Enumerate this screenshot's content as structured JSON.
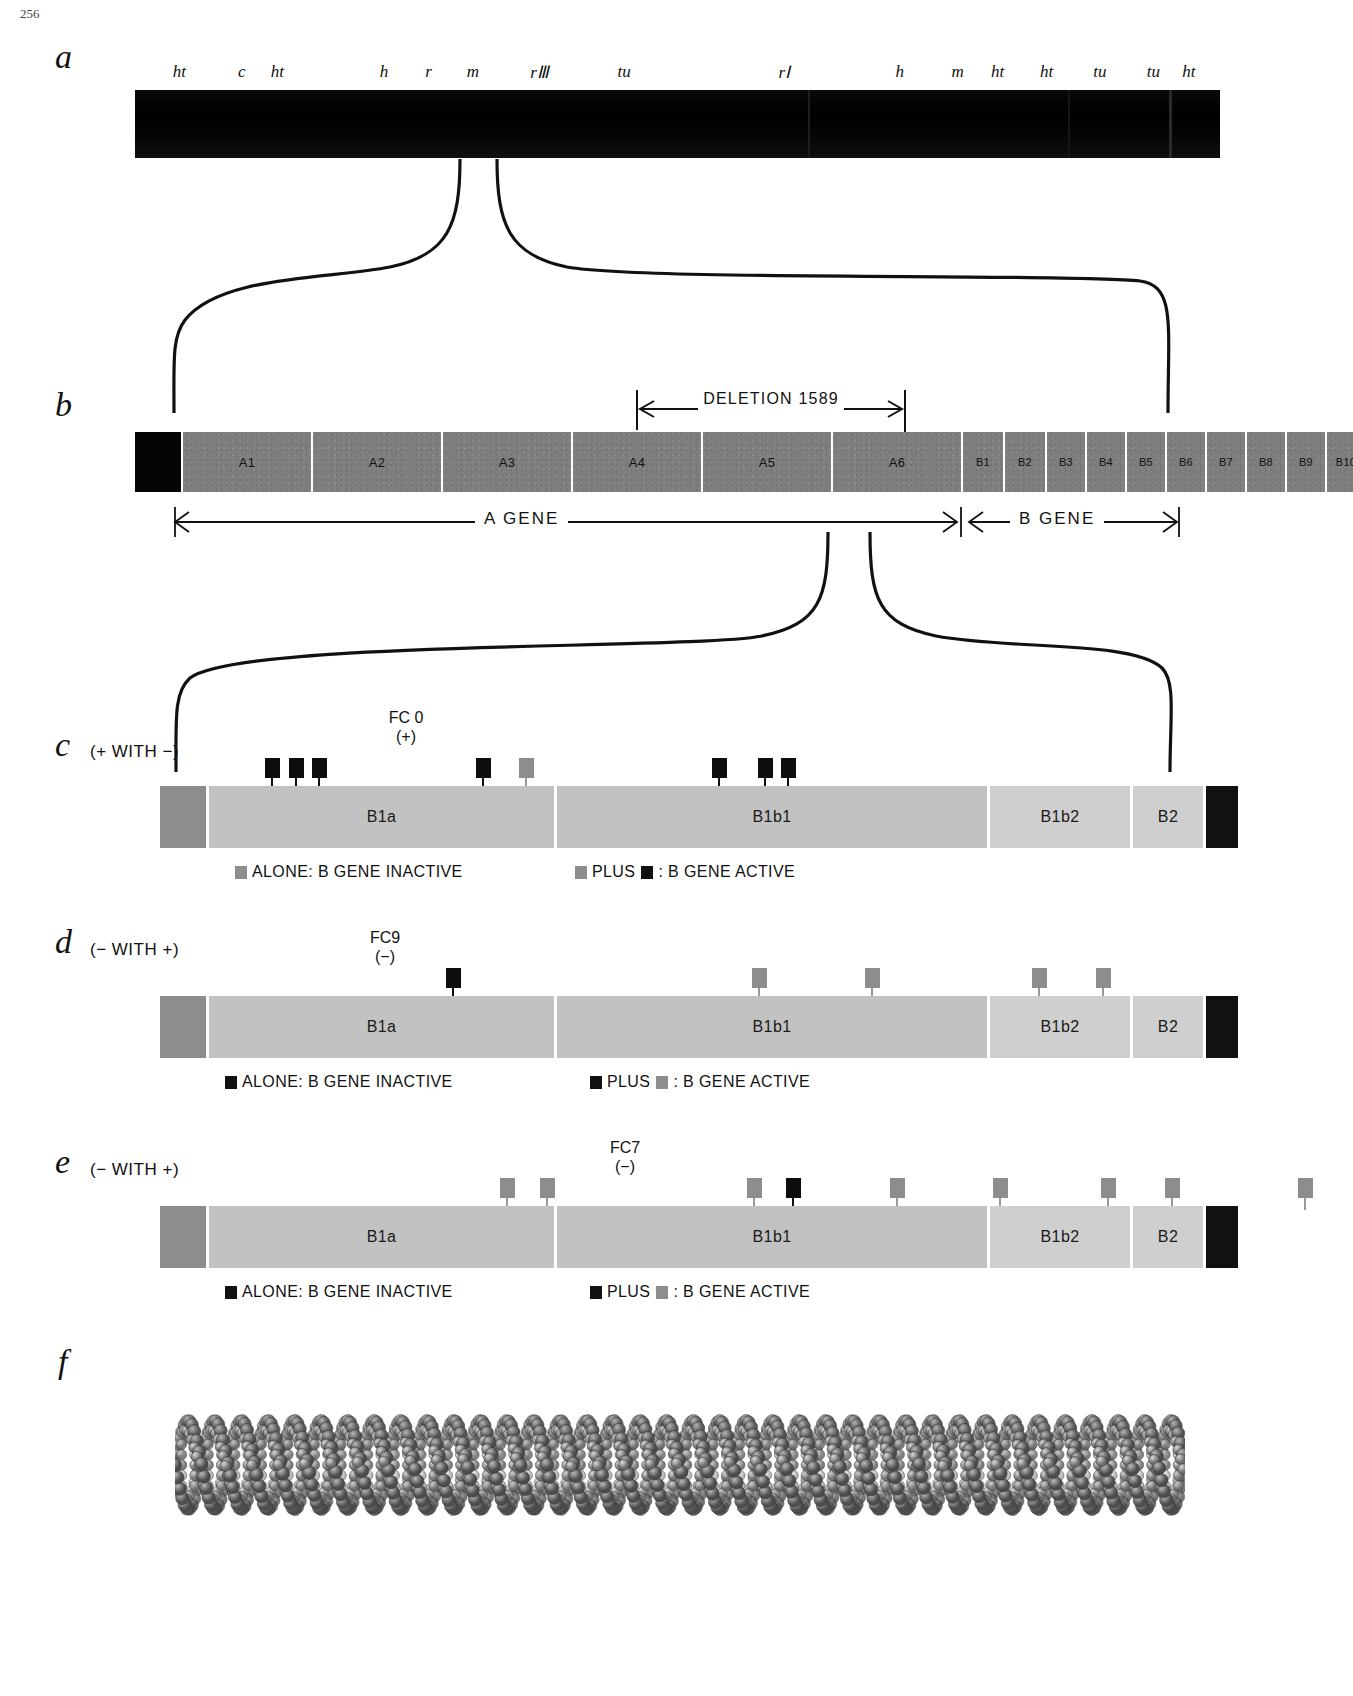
{
  "page": {
    "number": "256"
  },
  "panels": {
    "a": {
      "letter": "a",
      "caption": "",
      "genetic_markers": [
        "ht",
        "c",
        "ht",
        "h",
        "r",
        "m",
        "rII",
        "tu",
        "rI",
        "h",
        "m",
        "ht",
        "ht",
        "tu",
        "tu",
        "ht"
      ],
      "marker_positions_pct": [
        5.0,
        12.0,
        16.0,
        28.0,
        33.0,
        38.0,
        45.5,
        55.0,
        73.0,
        86.0,
        92.5,
        97.0,
        102.5,
        108.5,
        114.5,
        118.5
      ],
      "bar_color": "#050505"
    },
    "b": {
      "letter": "b",
      "deletion_label": "DELETION 1589",
      "a_gene_label": "A GENE",
      "b_gene_label": "B GENE",
      "a_segments": [
        "A1",
        "A2",
        "A3",
        "A4",
        "A5",
        "A6"
      ],
      "b_segments": [
        "B1",
        "B2",
        "B3",
        "B4",
        "B5",
        "B6",
        "B7",
        "B8",
        "B9",
        "B10"
      ],
      "segment_color": "#7e7e7e",
      "cap_color": "#050505"
    },
    "c": {
      "letter": "c",
      "caption": "(+ WITH −)",
      "reference_mutant": {
        "name": "FC 0",
        "sign": "(+)"
      },
      "segments": [
        {
          "label": "",
          "kind": "dark"
        },
        {
          "label": "B1a",
          "kind": "mid"
        },
        {
          "label": "B1b1",
          "kind": "mid"
        },
        {
          "label": "B1b2",
          "kind": "light"
        },
        {
          "label": "B2",
          "kind": "light"
        },
        {
          "label": "",
          "kind": "black"
        }
      ],
      "markers": [
        {
          "x_pct": 6.6,
          "color": "black"
        },
        {
          "x_pct": 9.0,
          "color": "black"
        },
        {
          "x_pct": 11.4,
          "color": "black"
        },
        {
          "x_pct": 28.0,
          "color": "black"
        },
        {
          "x_pct": 32.4,
          "color": "gray"
        },
        {
          "x_pct": 52.0,
          "color": "black"
        },
        {
          "x_pct": 56.6,
          "color": "black"
        },
        {
          "x_pct": 59.0,
          "color": "black"
        }
      ],
      "legend": [
        {
          "swatch": "gray",
          "text": "ALONE: B GENE INACTIVE"
        },
        {
          "swatch": "gray",
          "text2_swatch": "black",
          "text_a": "PLUS",
          "text_b": ": B GENE ACTIVE"
        }
      ],
      "legend_left": "ALONE: B GENE INACTIVE",
      "legend_right_a": "PLUS",
      "legend_right_b": ": B GENE ACTIVE"
    },
    "d": {
      "letter": "d",
      "caption": "(− WITH +)",
      "reference_mutant": {
        "name": "FC9",
        "sign": "(−)"
      },
      "segments": [
        {
          "label": "",
          "kind": "dark"
        },
        {
          "label": "B1a",
          "kind": "mid"
        },
        {
          "label": "B1b1",
          "kind": "mid"
        },
        {
          "label": "B1b2",
          "kind": "light"
        },
        {
          "label": "B2",
          "kind": "light"
        },
        {
          "label": "",
          "kind": "black"
        }
      ],
      "markers": [
        {
          "x_pct": 25.0,
          "color": "black"
        },
        {
          "x_pct": 56.0,
          "color": "gray"
        },
        {
          "x_pct": 67.5,
          "color": "gray"
        },
        {
          "x_pct": 84.5,
          "color": "gray"
        },
        {
          "x_pct": 91.0,
          "color": "gray"
        },
        {
          "x_pct": 117.5,
          "color": "gray"
        }
      ],
      "legend_left": "ALONE: B GENE INACTIVE",
      "legend_right_a": "PLUS",
      "legend_right_b": ": B GENE ACTIVE"
    },
    "e": {
      "letter": "e",
      "caption": "(− WITH +)",
      "reference_mutant": {
        "name": "FC7",
        "sign": "(−)"
      },
      "segments": [
        {
          "label": "",
          "kind": "dark"
        },
        {
          "label": "B1a",
          "kind": "mid"
        },
        {
          "label": "B1b1",
          "kind": "mid"
        },
        {
          "label": "B1b2",
          "kind": "light"
        },
        {
          "label": "B2",
          "kind": "light"
        },
        {
          "label": "",
          "kind": "black"
        }
      ],
      "markers": [
        {
          "x_pct": 30.5,
          "color": "gray"
        },
        {
          "x_pct": 34.5,
          "color": "gray"
        },
        {
          "x_pct": 55.5,
          "color": "gray"
        },
        {
          "x_pct": 59.5,
          "color": "black"
        },
        {
          "x_pct": 70.0,
          "color": "gray"
        },
        {
          "x_pct": 80.5,
          "color": "gray"
        },
        {
          "x_pct": 91.5,
          "color": "gray"
        },
        {
          "x_pct": 98.0,
          "color": "gray"
        },
        {
          "x_pct": 111.5,
          "color": "gray"
        }
      ],
      "legend_left": "ALONE: B GENE INACTIVE",
      "legend_right_a": "PLUS",
      "legend_right_b": ": B GENE ACTIVE"
    },
    "f": {
      "letter": "f",
      "caption": "",
      "model": "dna-double-helix-space-filling"
    }
  },
  "icons": {
    "arrow_left": "left-arrow-icon",
    "arrow_right": "right-arrow-icon",
    "bracket": "bracket-icon"
  },
  "colors": {
    "black": "#050505",
    "gene_gray": "#7e7e7e",
    "cistron_dark": "#8d8d8d",
    "cistron_mid": "#c2c2c2",
    "cistron_light": "#cfcfcf",
    "marker_gray": "#8d8d8d",
    "marker_black": "#0d0d0d"
  }
}
